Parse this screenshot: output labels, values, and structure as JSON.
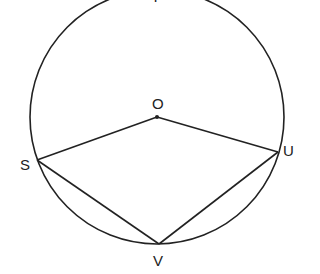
{
  "diagram": {
    "type": "circle-geometry",
    "circle": {
      "center": "O",
      "cx": 157,
      "cy": 117,
      "r": 127
    },
    "points": [
      {
        "name": "O",
        "label": "O",
        "x": 157,
        "y": 117
      },
      {
        "name": "S",
        "label": "S",
        "x": 37,
        "y": 160
      },
      {
        "name": "U",
        "label": "U",
        "x": 278,
        "y": 152
      },
      {
        "name": "V",
        "label": "V",
        "x": 159,
        "y": 244
      },
      {
        "name": "T",
        "label": "T",
        "x": 157,
        "y": -10
      }
    ],
    "segments": [
      [
        "O",
        "S"
      ],
      [
        "O",
        "U"
      ],
      [
        "S",
        "V"
      ],
      [
        "U",
        "V"
      ]
    ],
    "stroke_color": "#222222"
  },
  "labels": {
    "O": "O",
    "S": "S",
    "U": "U",
    "V": "V",
    "T": "T"
  }
}
